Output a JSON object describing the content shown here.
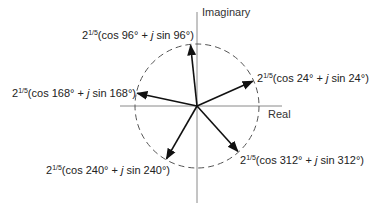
{
  "diagram": {
    "axes": {
      "vertical_label": "Imaginary",
      "horizontal_label": "Real"
    },
    "circle": {
      "style": "dashed",
      "radius_label": "2^(1/5)"
    },
    "colors": {
      "axis": "#888888",
      "circle": "#555555",
      "arrow": "#111111",
      "text": "#222222"
    },
    "roots": [
      {
        "angle_deg": 24,
        "base": "2",
        "exponent": "1/5",
        "expr": "(cos 24° + ",
        "j": "j",
        "expr2": " sin 24°)"
      },
      {
        "angle_deg": 96,
        "base": "2",
        "exponent": "1/5",
        "expr": "(cos 96° + ",
        "j": "j",
        "expr2": " sin 96°)"
      },
      {
        "angle_deg": 168,
        "base": "2",
        "exponent": "1/5",
        "expr": "(cos 168° + ",
        "j": "j",
        "expr2": " sin 168°)"
      },
      {
        "angle_deg": 240,
        "base": "2",
        "exponent": "1/5",
        "expr": "(cos 240° + ",
        "j": "j",
        "expr2": " sin 240°)"
      },
      {
        "angle_deg": 312,
        "base": "2",
        "exponent": "1/5",
        "expr": "(cos 312° + ",
        "j": "j",
        "expr2": " sin 312°)"
      }
    ]
  }
}
